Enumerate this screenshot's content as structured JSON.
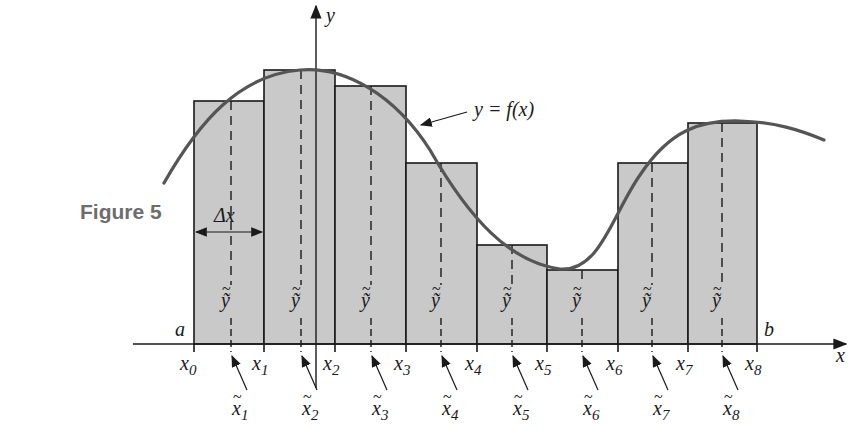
{
  "caption": "Figure 5",
  "colors": {
    "rect_fill": "#c9c9c9",
    "curve": "#555555",
    "line": "#1a1a1a",
    "caption": "#6d6d6d"
  },
  "axes": {
    "x_label": "x",
    "y_label": "y",
    "left_end_label": "a",
    "right_end_label": "b"
  },
  "curve_label": "y = f(x)",
  "delta_label": "Δx",
  "partition_labels": [
    "x0",
    "x1",
    "x2",
    "x3",
    "x4",
    "x5",
    "x6",
    "x7",
    "x8"
  ],
  "sample_x_labels": [
    "x̃1",
    "x̃2",
    "x̃3",
    "x̃4",
    "x̃5",
    "x̃6",
    "x̃7",
    "x̃8"
  ],
  "sample_y_labels": [
    "ỹ1",
    "ỹ2",
    "ỹ3",
    "ỹ4",
    "ỹ5",
    "ỹ6",
    "ỹ7",
    "ỹ8"
  ],
  "rectangles": [
    {
      "x0": 194,
      "x1": 264,
      "top": 101,
      "sample_x": 231
    },
    {
      "x0": 264,
      "x1": 335,
      "top": 70,
      "sample_x": 301
    },
    {
      "x0": 335,
      "x1": 406,
      "top": 86,
      "sample_x": 371
    },
    {
      "x0": 406,
      "x1": 477,
      "top": 163,
      "sample_x": 441
    },
    {
      "x0": 477,
      "x1": 547,
      "top": 245,
      "sample_x": 512
    },
    {
      "x0": 547,
      "x1": 618,
      "top": 270,
      "sample_x": 582
    },
    {
      "x0": 618,
      "x1": 688,
      "top": 163,
      "sample_x": 652
    },
    {
      "x0": 688,
      "x1": 757,
      "top": 123,
      "sample_x": 722
    }
  ]
}
